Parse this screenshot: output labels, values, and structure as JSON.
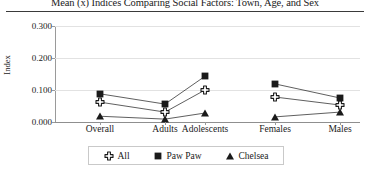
{
  "chart_data": {
    "type": "line",
    "title": "Mean (x̄) Indices Comparing Social Factors: Town, Age, and Sex",
    "xlabel": "",
    "ylabel": "Index",
    "categories": [
      "Overall",
      "Adults",
      "Adolescents",
      "Females",
      "Males"
    ],
    "ylim": [
      0.0,
      0.3
    ],
    "yticks": [
      "0.000",
      "0.100",
      "0.200",
      "0.300"
    ],
    "ytick_values": [
      0.0,
      0.1,
      0.2,
      0.3
    ],
    "grid": true,
    "legend_position": "bottom-center",
    "series": [
      {
        "name": "All",
        "marker": "plus-outline",
        "color": "#1a1a1a",
        "values": [
          0.062,
          0.031,
          0.1,
          0.078,
          0.053
        ],
        "connected": [
          false,
          true,
          true,
          false,
          true
        ]
      },
      {
        "name": "Paw Paw",
        "marker": "filled-square",
        "color": "#1a1a1a",
        "values": [
          0.088,
          0.056,
          0.143,
          0.119,
          0.075
        ],
        "connected": [
          false,
          true,
          true,
          false,
          true
        ]
      },
      {
        "name": "Chelsea",
        "marker": "filled-triangle",
        "color": "#1a1a1a",
        "values": [
          0.018,
          0.009,
          0.028,
          0.016,
          0.031
        ],
        "connected": [
          false,
          true,
          true,
          false,
          true
        ]
      }
    ]
  },
  "legend": {
    "entries": [
      {
        "label": "All",
        "marker": "plus-outline-icon"
      },
      {
        "label": "Paw Paw",
        "marker": "filled-square-icon"
      },
      {
        "label": "Chelsea",
        "marker": "filled-triangle-icon"
      }
    ]
  },
  "axis": {
    "y_title": "Index",
    "y_labels": [
      "0.300",
      "0.200",
      "0.100",
      "0.000"
    ],
    "x_labels": [
      "Overall",
      "Adults",
      "Adolescents",
      "Females",
      "Males"
    ]
  },
  "colors": {
    "ink": "#1a1a1a",
    "grid": "#e2e2e2",
    "spine": "#9a9a9a",
    "rule": "#3a3a3a",
    "legend_border": "#c9c9c9",
    "background": "#ffffff"
  }
}
